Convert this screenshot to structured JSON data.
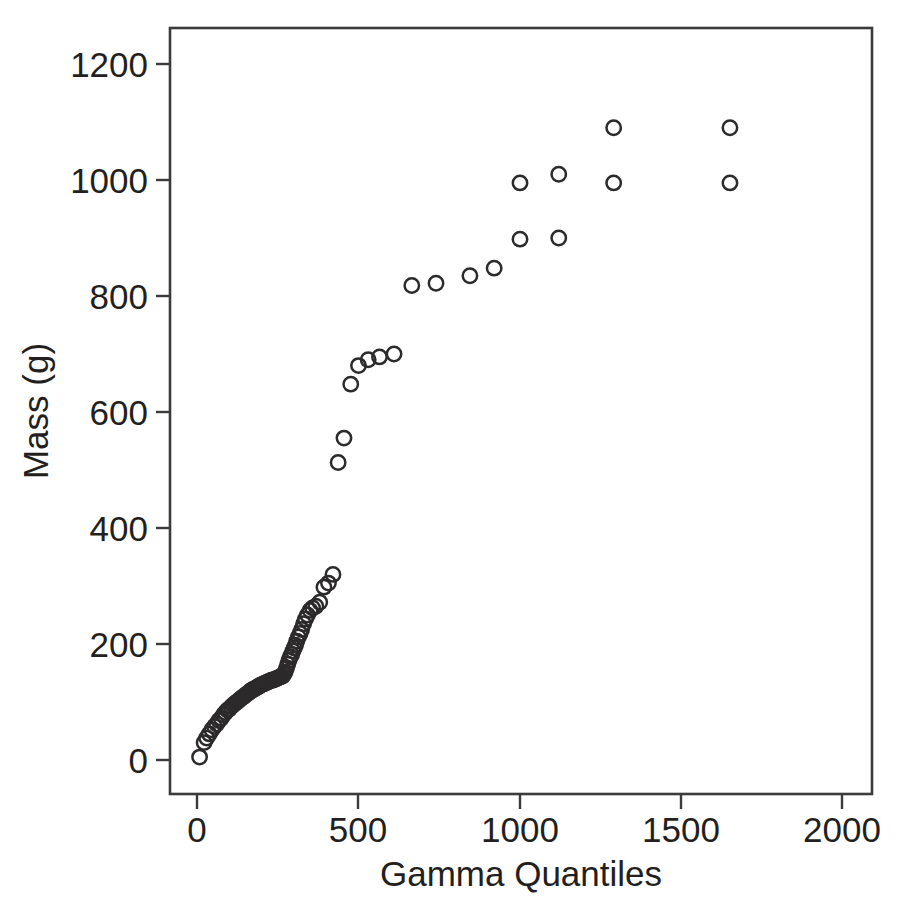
{
  "chart_data": {
    "type": "scatter",
    "title": "",
    "subtitle": "",
    "xlabel": "Gamma Quantiles",
    "ylabel": "Mass (g)",
    "xlim": [
      -100,
      2120
    ],
    "ylim": [
      -75,
      1290
    ],
    "grid": false,
    "legend": null,
    "marker": "open-circle",
    "marker_color": "#2c2a2b",
    "xticks": [
      0,
      500,
      1000,
      1500,
      2000
    ],
    "xticklabels": [
      "0",
      "500",
      "1000",
      "1500",
      "2000"
    ],
    "yticks": [
      0,
      200,
      400,
      600,
      800,
      1000,
      1200
    ],
    "yticklabels": [
      "0",
      "200",
      "400",
      "600",
      "800",
      "1000",
      "1200"
    ],
    "series": [
      {
        "name": "Mass vs Gamma Quantiles",
        "x": [
          8,
          22,
          30,
          38,
          46,
          54,
          61,
          68,
          75,
          82,
          88,
          94,
          100,
          106,
          112,
          118,
          124,
          130,
          136,
          141,
          146,
          150,
          155,
          160,
          164,
          168,
          172,
          177,
          181,
          185,
          189,
          193,
          197,
          201,
          205,
          209,
          213,
          217,
          221,
          225,
          229,
          233,
          237,
          241,
          245,
          249,
          253,
          257,
          261,
          265,
          269,
          273,
          277,
          281,
          285,
          289,
          293,
          297,
          301,
          305,
          309,
          314,
          319,
          324,
          330,
          336,
          342,
          350,
          358,
          368,
          380,
          393,
          407,
          421,
          437,
          455,
          476,
          500,
          530,
          565,
          610,
          665,
          740,
          845,
          920,
          1000,
          1120,
          1290,
          1650
        ],
        "y": [
          5,
          30,
          38,
          45,
          52,
          58,
          62,
          68,
          72,
          78,
          82,
          86,
          88,
          92,
          95,
          98,
          100,
          103,
          106,
          108,
          110,
          112,
          114,
          116,
          118,
          120,
          121,
          122,
          124,
          125,
          126,
          128,
          129,
          130,
          131,
          132,
          133,
          134,
          135,
          136,
          137,
          138,
          138,
          139,
          140,
          141,
          142,
          143,
          144,
          145,
          148,
          152,
          158,
          165,
          172,
          178,
          182,
          188,
          193,
          198,
          205,
          212,
          218,
          225,
          235,
          243,
          250,
          258,
          262,
          265,
          272,
          298,
          305,
          320,
          513,
          555,
          648,
          680,
          690,
          695,
          700,
          818,
          822,
          835,
          848,
          898,
          900,
          995,
          995
        ]
      },
      {
        "name": "Mass vs Gamma Quantiles (upper tail)",
        "x": [
          1000,
          1120,
          1290,
          1650
        ],
        "y": [
          995,
          1010,
          1090,
          1090
        ]
      }
    ]
  },
  "axes": {
    "x_title": "Gamma Quantiles",
    "y_title": "Mass (g)",
    "x_tick_labels": [
      "0",
      "500",
      "1000",
      "1500",
      "2000"
    ],
    "y_tick_labels": [
      "0",
      "200",
      "400",
      "600",
      "800",
      "1000",
      "1200"
    ]
  },
  "style": {
    "frame_color": "#3b3b3b",
    "marker_stroke": "#2c2a2b",
    "background": "#ffffff",
    "text_color": "#231f20"
  }
}
